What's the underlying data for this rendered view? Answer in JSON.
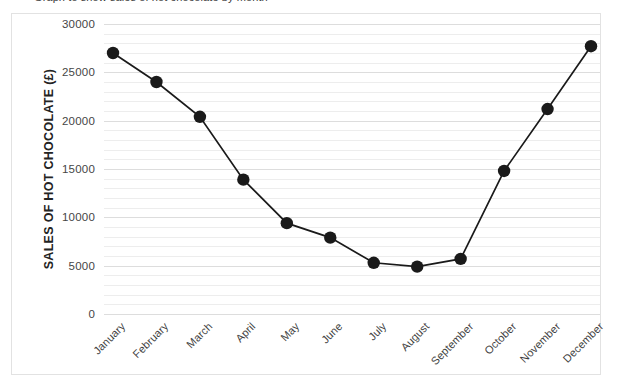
{
  "top_cropped_text": "Graph to show sales of hot chocolate by month",
  "chart_data": {
    "type": "line",
    "title": "",
    "xlabel": "",
    "ylabel": "SALES OF HOT CHOCOLATE (£)",
    "categories": [
      "January",
      "February",
      "March",
      "April",
      "May",
      "June",
      "July",
      "August",
      "September",
      "October",
      "November",
      "December"
    ],
    "values": [
      27000,
      24000,
      20400,
      13900,
      9400,
      7900,
      5300,
      4900,
      5700,
      14800,
      21200,
      27700
    ],
    "ylim": [
      0,
      30000
    ],
    "ytick_step": 5000,
    "yticks": [
      "30000",
      "25000",
      "20000",
      "15000",
      "10000",
      "5000",
      "0"
    ],
    "ytick_values": [
      30000,
      25000,
      20000,
      15000,
      10000,
      5000,
      0
    ],
    "minor_gridline_step": 1000,
    "grid": true,
    "legend": "none",
    "marker": "circle",
    "marker_color": "#1a1a1a",
    "line_color": "#1a1a1a",
    "gridline_color": "#ededed",
    "frame_color": "#e2e2e2"
  }
}
